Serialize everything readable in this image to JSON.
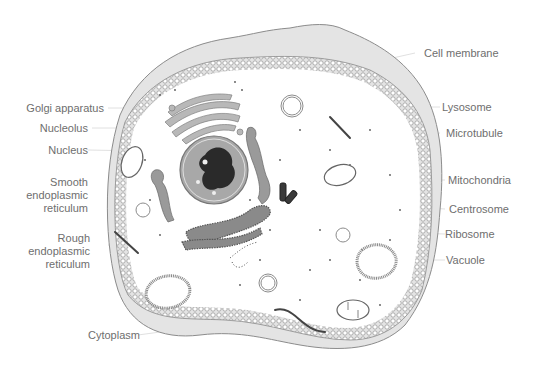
{
  "diagram": {
    "labels_left": [
      {
        "id": "golgi",
        "text": "Golgi apparatus"
      },
      {
        "id": "nucleolus",
        "text": "Nucleolus"
      },
      {
        "id": "nucleus",
        "text": "Nucleus"
      },
      {
        "id": "smooth_er",
        "lines": [
          "Smooth",
          "endoplasmic",
          "reticulum"
        ]
      },
      {
        "id": "rough_er",
        "lines": [
          "Rough",
          "endoplasmic",
          "reticulum"
        ]
      },
      {
        "id": "cytoplasm",
        "text": "Cytoplasm"
      }
    ],
    "labels_right": [
      {
        "id": "cell_membrane",
        "text": "Cell membrane"
      },
      {
        "id": "lysosome",
        "text": "Lysosome"
      },
      {
        "id": "microtubule",
        "text": "Microtubule"
      },
      {
        "id": "mitochondria",
        "text": "Mitochondria"
      },
      {
        "id": "centrosome",
        "text": "Centrosome"
      },
      {
        "id": "ribosome",
        "text": "Ribosome"
      },
      {
        "id": "vacuole",
        "text": "Vacuole"
      }
    ],
    "colors": {
      "label_text": "#6e6e6e",
      "leader_line": "#d8d8d8",
      "membrane_outer": "#e4e4e4",
      "membrane_stroke": "#8c8c8c",
      "organelle_gray": "#9a9a9a",
      "nucleus_fill": "#a8a8a8",
      "chromatin": "#2a2a2a"
    }
  }
}
